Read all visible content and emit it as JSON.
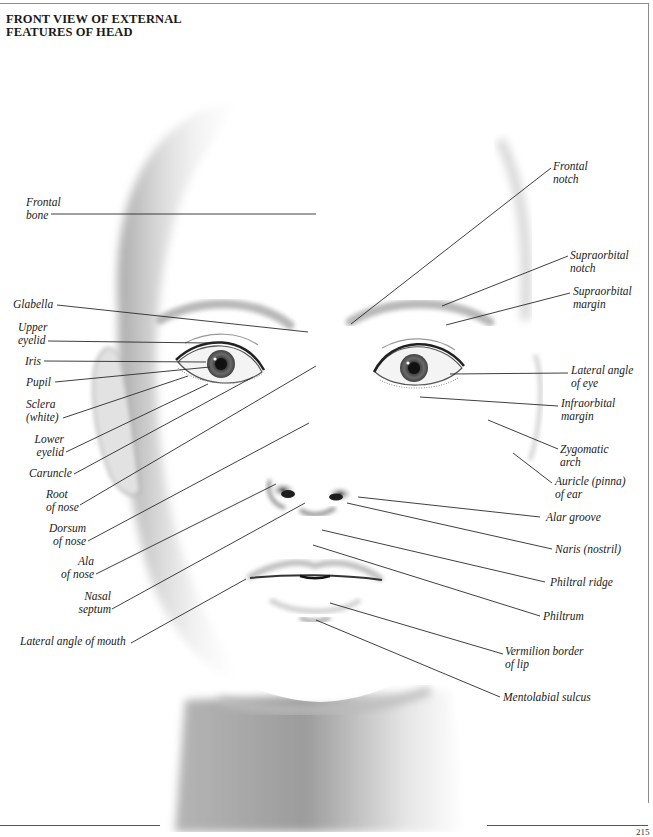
{
  "page": {
    "title": "FRONT VIEW OF EXTERNAL\nFEATURES OF HEAD",
    "page_number": "215"
  },
  "colors": {
    "leader_line": "#2a2a2a",
    "frame": "#8a8a8a",
    "shading_dark": "#6e6e6e",
    "iris": "#4a4a4a"
  },
  "labels_left": [
    {
      "id": "frontal-bone",
      "text": "Frontal\nbone"
    },
    {
      "id": "glabella",
      "text": "Glabella"
    },
    {
      "id": "upper-eyelid",
      "text": "Upper\neyelid"
    },
    {
      "id": "iris",
      "text": "Iris"
    },
    {
      "id": "pupil",
      "text": "Pupil"
    },
    {
      "id": "sclera",
      "text": "Sclera\n(white)"
    },
    {
      "id": "lower-eyelid",
      "text": "Lower\neyelid"
    },
    {
      "id": "caruncle",
      "text": "Caruncle"
    },
    {
      "id": "root-of-nose",
      "text": "Root\nof nose"
    },
    {
      "id": "dorsum-of-nose",
      "text": "Dorsum\nof nose"
    },
    {
      "id": "ala-of-nose",
      "text": "Ala\nof nose"
    },
    {
      "id": "nasal-septum",
      "text": "Nasal\nseptum"
    },
    {
      "id": "lateral-angle-of-mouth",
      "text": "Lateral angle of mouth"
    }
  ],
  "labels_right": [
    {
      "id": "frontal-notch",
      "text": "Frontal\nnotch"
    },
    {
      "id": "supraorbital-notch",
      "text": "Supraorbital\nnotch"
    },
    {
      "id": "supraorbital-margin",
      "text": "Supraorbital\nmargin"
    },
    {
      "id": "lateral-angle-of-eye",
      "text": "Lateral angle\nof eye"
    },
    {
      "id": "infraorbital-margin",
      "text": "Infraorbital\nmargin"
    },
    {
      "id": "zygomatic-arch",
      "text": "Zygomatic\narch"
    },
    {
      "id": "auricle",
      "text": "Auricle (pinna)\nof ear"
    },
    {
      "id": "alar-groove",
      "text": "Alar groove"
    },
    {
      "id": "naris",
      "text": "Naris (nostril)"
    },
    {
      "id": "philtral-ridge",
      "text": "Philtral ridge"
    },
    {
      "id": "philtrum",
      "text": "Philtrum"
    },
    {
      "id": "vermilion-border",
      "text": "Vermilion border\nof lip"
    },
    {
      "id": "mentolabial-sulcus",
      "text": "Mentolabial sulcus"
    }
  ]
}
